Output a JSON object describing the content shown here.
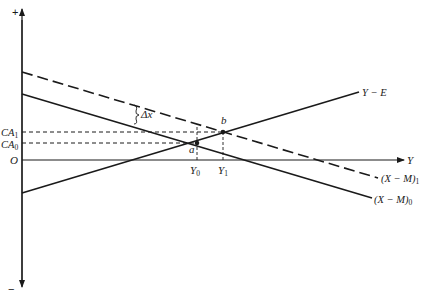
{
  "diagram": {
    "type": "economics-line-diagram",
    "axes": {
      "vertical_top_sign": "+",
      "vertical_bottom_sign": "−",
      "horizontal_label": "Y",
      "origin_label": "O"
    },
    "vertical_labels": {
      "ca1": "CA",
      "ca1_sub": "1",
      "ca0": "CA",
      "ca0_sub": "0"
    },
    "horizontal_labels": {
      "y0": "Y",
      "y0_sub": "0",
      "y1": "Y",
      "y1_sub": "1"
    },
    "lines": [
      {
        "id": "xm1",
        "label": "(X − M)",
        "sub": "1",
        "style": "dashed",
        "slope": "negative"
      },
      {
        "id": "xm0",
        "label": "(X − M)",
        "sub": "0",
        "style": "solid",
        "slope": "negative"
      },
      {
        "id": "ye",
        "label": "Y − E",
        "style": "solid",
        "slope": "positive"
      }
    ],
    "points": [
      {
        "id": "a",
        "label": "a",
        "meaning": "intersection of Y−E and (X−M)0 at (Y0, CA0)"
      },
      {
        "id": "b",
        "label": "b",
        "meaning": "intersection of Y−E and (X−M)1 at (Y1, CA1)"
      }
    ],
    "shift_annotation": "Δx"
  },
  "colors": {
    "ink": "#1a1a1a",
    "background": "#ffffff"
  }
}
